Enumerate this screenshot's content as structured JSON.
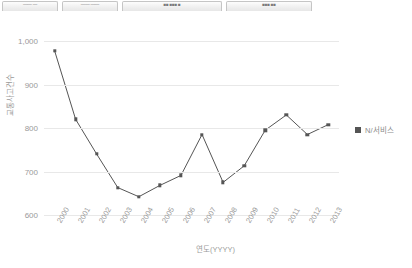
{
  "toolbar": {
    "buttons": [
      {
        "name": "toolbar-button-1",
        "label": "—— —"
      },
      {
        "name": "toolbar-button-2",
        "label": "—— ——"
      },
      {
        "name": "toolbar-button-3",
        "label": "■■ ■■■ ■"
      },
      {
        "name": "toolbar-button-4",
        "label": "■■■ ■■"
      }
    ]
  },
  "legend": {
    "label": "N/서비스",
    "color": "#555555"
  },
  "chart_data": {
    "type": "line",
    "title": "",
    "xlabel": "연도(YYYY)",
    "ylabel": "교통사고건수",
    "categories": [
      "2000",
      "2001",
      "2002",
      "2003",
      "2004",
      "2005",
      "2006",
      "2007",
      "2008",
      "2009",
      "2010",
      "2011",
      "2012",
      "2013"
    ],
    "series": [
      {
        "name": "N/서비스",
        "color": "#555555",
        "values": [
          978,
          820,
          740,
          663,
          642,
          668,
          691,
          785,
          675,
          713,
          795,
          830,
          785,
          808
        ]
      }
    ],
    "yticks": [
      "600",
      "700",
      "800",
      "900",
      "1,000"
    ],
    "ytick_values": [
      600,
      700,
      800,
      900,
      1000
    ],
    "ylim": [
      600,
      1000
    ],
    "grid": true,
    "legend_position": "right",
    "marker": "square"
  }
}
